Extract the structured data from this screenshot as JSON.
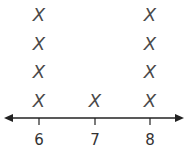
{
  "chart_data": {
    "type": "dot",
    "title": "",
    "xlabel": "",
    "ylabel": "",
    "categories": [
      "6",
      "7",
      "8"
    ],
    "values": [
      4,
      1,
      4
    ],
    "marker": "X",
    "axis": {
      "arrows": "both",
      "xlim": [
        5.4,
        8.6
      ],
      "grid": false
    },
    "legend": null
  },
  "colors": {
    "mark": "#4a4a4a",
    "axis": "#222222",
    "label": "#333333"
  }
}
